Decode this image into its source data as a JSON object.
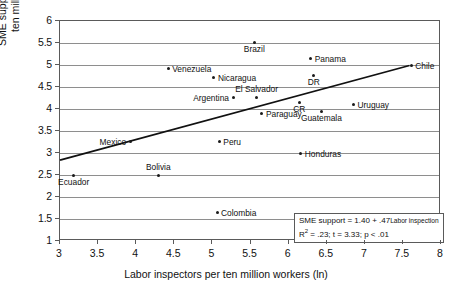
{
  "chart_data": {
    "type": "scatter",
    "title": "",
    "xlabel": "Labor inspectors per ten million workers (ln)",
    "ylabel": "SME support personnel per ten million people (ln)",
    "xlim": [
      3,
      8
    ],
    "ylim": [
      1,
      6
    ],
    "xticks": [
      "3",
      "3.5",
      "4",
      "4.5",
      "5",
      "5.5",
      "6",
      "6.5",
      "7",
      "7.5",
      "8"
    ],
    "yticks": [
      "1",
      "1.5",
      "2",
      "2.5",
      "3",
      "3.5",
      "4",
      "4.5",
      "5",
      "5.5",
      "6"
    ],
    "grid": "horizontal",
    "legend": "none",
    "points": [
      {
        "label": "Ecuador",
        "x": 3.18,
        "y": 2.5,
        "label_pos": "below"
      },
      {
        "label": "Mexico",
        "x": 3.92,
        "y": 3.27,
        "label_pos": "left"
      },
      {
        "label": "Bolivia",
        "x": 4.29,
        "y": 2.5,
        "label_pos": "above"
      },
      {
        "label": "Venezuela",
        "x": 4.42,
        "y": 4.93,
        "label_pos": "right"
      },
      {
        "label": "Colombia",
        "x": 5.06,
        "y": 1.64,
        "label_pos": "right"
      },
      {
        "label": "Peru",
        "x": 5.09,
        "y": 3.27,
        "label_pos": "right"
      },
      {
        "label": "Nicaragua",
        "x": 5.02,
        "y": 4.71,
        "label_pos": "right"
      },
      {
        "label": "Argentina",
        "x": 5.27,
        "y": 4.27,
        "label_pos": "left"
      },
      {
        "label": "El Salvador",
        "x": 5.58,
        "y": 4.27,
        "label_pos": "above"
      },
      {
        "label": "Brazil",
        "x": 5.55,
        "y": 5.52,
        "label_pos": "below"
      },
      {
        "label": "Paraguay",
        "x": 5.65,
        "y": 3.89,
        "label_pos": "right"
      },
      {
        "label": "CR",
        "x": 6.14,
        "y": 4.16,
        "label_pos": "below"
      },
      {
        "label": "Honduras",
        "x": 6.16,
        "y": 2.98,
        "label_pos": "right"
      },
      {
        "label": "Panama",
        "x": 6.29,
        "y": 5.16,
        "label_pos": "right"
      },
      {
        "label": "DR",
        "x": 6.33,
        "y": 4.77,
        "label_pos": "below"
      },
      {
        "label": "Guatemala",
        "x": 6.43,
        "y": 3.95,
        "label_pos": "below"
      },
      {
        "label": "Uruguay",
        "x": 6.85,
        "y": 4.11,
        "label_pos": "right"
      },
      {
        "label": "Chile",
        "x": 7.61,
        "y": 4.98,
        "label_pos": "right"
      }
    ],
    "trendline": {
      "x_start": 3.0,
      "y_start": 2.81,
      "x_end": 7.61,
      "y_end": 4.98,
      "equation_intercept": "1.40",
      "equation_slope": ".47"
    },
    "annotation": {
      "line1_prefix": "SME support = 1.40 + .47",
      "line1_subscript": "Labor inspection",
      "line2_r2_label": "R",
      "line2_r2_exp": "2",
      "line2_rest": " = .23; t = 3.33; p < .01"
    }
  }
}
